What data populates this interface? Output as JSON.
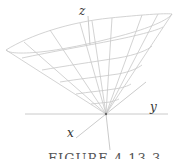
{
  "figure": {
    "caption": "FIGURE 4.13.3",
    "axes": {
      "x_label": "x",
      "y_label": "y",
      "z_label": "z"
    },
    "surface": "cone",
    "colors": {
      "mesh": "#c8c8c8",
      "axes": "#b8b8b8",
      "labels": "#333333"
    }
  }
}
